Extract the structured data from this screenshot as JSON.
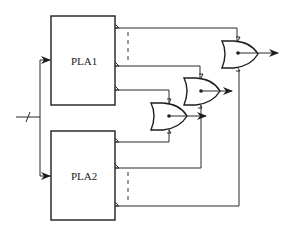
{
  "diagram": {
    "type": "logic-circuit",
    "blocks": [
      {
        "id": "pla1",
        "label": "PLA1"
      },
      {
        "id": "pla2",
        "label": "PLA2"
      }
    ],
    "gates": [
      {
        "id": "or1",
        "type": "XOR/OR-style gate",
        "inputs": [
          "PLA1 output 3",
          "PLA2 output 1"
        ]
      },
      {
        "id": "or2",
        "type": "XOR/OR-style gate",
        "inputs": [
          "PLA1 output 2",
          "PLA2 output 2"
        ]
      },
      {
        "id": "or3",
        "type": "XOR/OR-style gate",
        "inputs": [
          "PLA1 output 1",
          "PLA2 output n"
        ]
      }
    ],
    "input_bus": {
      "slash_marked": true,
      "feeds": [
        "pla1",
        "pla2"
      ]
    },
    "colors": {
      "stroke": "#1e1e1e",
      "background": "#ffffff"
    }
  }
}
